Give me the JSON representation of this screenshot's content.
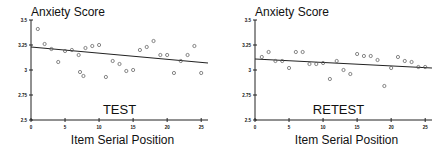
{
  "chart_data": [
    {
      "type": "scatter",
      "panel_label": "TEST",
      "title": "Anxiety Score",
      "xlabel": "Item Serial Position",
      "ylabel": "Anxiety Score",
      "xlim": [
        0,
        26
      ],
      "ylim": [
        2.5,
        3.5
      ],
      "xticks": [
        0,
        5,
        10,
        15,
        20,
        25
      ],
      "yticks": [
        2.5,
        2.75,
        3,
        3.25,
        3.5
      ],
      "ytick_labels": [
        "2.5",
        "2.75",
        "3",
        "3.25",
        "3.5"
      ],
      "grid": false,
      "points": [
        [
          1,
          3.41
        ],
        [
          2,
          3.26
        ],
        [
          3,
          3.21
        ],
        [
          4,
          3.08
        ],
        [
          5,
          3.19
        ],
        [
          6,
          3.2
        ],
        [
          7,
          3.15
        ],
        [
          7.2,
          2.98
        ],
        [
          7.7,
          2.94
        ],
        [
          8,
          3.22
        ],
        [
          9,
          3.24
        ],
        [
          10,
          3.25
        ],
        [
          11,
          2.93
        ],
        [
          12,
          3.09
        ],
        [
          13,
          3.06
        ],
        [
          14,
          2.99
        ],
        [
          15,
          3.0
        ],
        [
          16,
          3.2
        ],
        [
          17,
          3.23
        ],
        [
          18,
          3.29
        ],
        [
          19,
          3.15
        ],
        [
          20,
          3.15
        ],
        [
          21,
          2.97
        ],
        [
          22,
          3.09
        ],
        [
          23,
          3.15
        ],
        [
          24,
          3.24
        ],
        [
          25,
          2.97
        ]
      ],
      "trendline": {
        "x": [
          0,
          26
        ],
        "y": [
          3.23,
          3.07
        ]
      }
    },
    {
      "type": "scatter",
      "panel_label": "RETEST",
      "title": "Anxiety Score",
      "xlabel": "Item Serial Position",
      "ylabel": "Anxiety Score",
      "xlim": [
        0,
        26
      ],
      "ylim": [
        2.5,
        3.5
      ],
      "xticks": [
        0,
        5,
        10,
        15,
        20,
        25
      ],
      "yticks": [
        2.5,
        2.75,
        3,
        3.25,
        3.5
      ],
      "ytick_labels": [
        "2.5",
        "2.75",
        "3",
        "3.25",
        "3.5"
      ],
      "grid": false,
      "points": [
        [
          1,
          3.13
        ],
        [
          2,
          3.18
        ],
        [
          3,
          3.09
        ],
        [
          4,
          3.09
        ],
        [
          5,
          3.02
        ],
        [
          6,
          3.18
        ],
        [
          7,
          3.18
        ],
        [
          8,
          3.06
        ],
        [
          9,
          3.06
        ],
        [
          10,
          3.07
        ],
        [
          11,
          2.91
        ],
        [
          12,
          3.09
        ],
        [
          13,
          3.0
        ],
        [
          14,
          2.96
        ],
        [
          15,
          3.16
        ],
        [
          16,
          3.14
        ],
        [
          17,
          3.14
        ],
        [
          18,
          3.1
        ],
        [
          19,
          2.84
        ],
        [
          20,
          3.02
        ],
        [
          21,
          3.13
        ],
        [
          22,
          3.09
        ],
        [
          23,
          3.08
        ],
        [
          24,
          3.03
        ],
        [
          25,
          3.03
        ]
      ],
      "trendline": {
        "x": [
          0,
          26
        ],
        "y": [
          3.11,
          3.02
        ]
      }
    }
  ],
  "colors": {
    "ink": "#222222",
    "marker": "#555555",
    "background": "#ffffff"
  }
}
